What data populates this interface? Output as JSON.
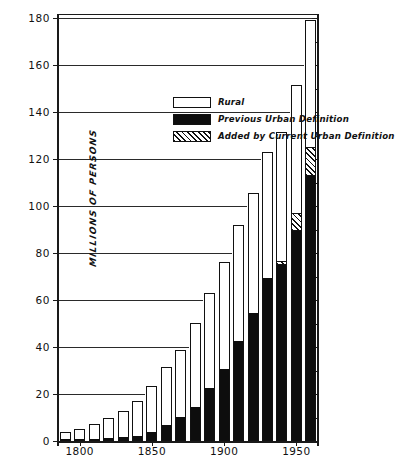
{
  "chart_data": {
    "type": "bar",
    "title": "",
    "subtitle": "",
    "xlabel": "",
    "ylabel": "MILLIONS OF PERSONS",
    "ylim": [
      0,
      180
    ],
    "ytick_values": [
      0,
      20,
      40,
      60,
      80,
      100,
      120,
      140,
      160,
      180
    ],
    "ytick_labels": [
      "0",
      "20",
      "40",
      "60",
      "80",
      "100",
      "120",
      "140",
      "160",
      "180"
    ],
    "xlim": [
      1785,
      1965
    ],
    "xtick_values": [
      1800,
      1850,
      1900,
      1950
    ],
    "xtick_labels": [
      "1800",
      "1850",
      "1900",
      "1950"
    ],
    "grid": true,
    "grid_axis": "y",
    "stacked": true,
    "legend_position": "upper-left-inside",
    "categories": [
      1790,
      1800,
      1810,
      1820,
      1830,
      1840,
      1850,
      1860,
      1870,
      1880,
      1890,
      1900,
      1910,
      1920,
      1930,
      1940,
      1950,
      1960
    ],
    "series": [
      {
        "name": "Previous Urban Definition",
        "color": "#0d0d0d",
        "pattern": "solid",
        "values": [
          0.2,
          0.3,
          0.5,
          0.7,
          1.1,
          1.8,
          3.5,
          6.2,
          9.9,
          14.1,
          22.1,
          30.2,
          42.0,
          54.2,
          69.0,
          74.4,
          88.9,
          112.5
        ]
      },
      {
        "name": "Added by Current Urban Definition",
        "color": "#ffffff",
        "pattern": "diagonal-hatch",
        "values": [
          0,
          0,
          0,
          0,
          0,
          0,
          0,
          0,
          0,
          0,
          0,
          0,
          0,
          0,
          0,
          1.6,
          7.8,
          12.0
        ]
      },
      {
        "name": "Rural",
        "color": "#ffffff",
        "pattern": "open",
        "values": [
          3.7,
          4.0,
          5.7,
          8.9,
          11.7,
          15.2,
          19.6,
          25.2,
          28.8,
          36.0,
          40.8,
          45.8,
          50.2,
          51.6,
          53.8,
          55.9,
          54.5,
          54.5
        ]
      }
    ],
    "totals": [
      3.9,
      5.3,
      7.2,
      9.6,
      12.9,
      17.1,
      23.2,
      31.4,
      38.6,
      50.2,
      62.9,
      76.0,
      92.0,
      105.7,
      122.8,
      131.7,
      151.3,
      179.3
    ]
  },
  "legend": {
    "items": [
      {
        "label": "Rural",
        "swatch": "rural-swatch"
      },
      {
        "label": "Previous Urban Definition",
        "swatch": "previous-urban-swatch"
      },
      {
        "label": "Added by Current Urban Definition",
        "swatch": "added-urban-swatch"
      }
    ]
  },
  "axes": {
    "y_title": "MILLIONS OF PERSONS"
  }
}
